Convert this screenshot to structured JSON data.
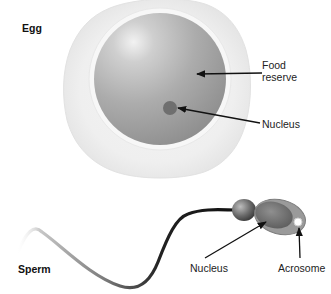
{
  "diagram": {
    "egg": {
      "title": "Egg",
      "labels": {
        "food_reserve_line1": "Food",
        "food_reserve_line2": "reserve",
        "nucleus": "Nucleus"
      }
    },
    "sperm": {
      "title": "Sperm",
      "labels": {
        "nucleus": "Nucleus",
        "acrosome": "Acrosome"
      }
    },
    "colors": {
      "background": "#ffffff",
      "jelly_coat": "#ececec",
      "cytoplasm": "#a9a9a9",
      "nucleus": "#6f6f6f",
      "tail": "#222222",
      "arrow": "#111111",
      "text": "#222222"
    }
  }
}
